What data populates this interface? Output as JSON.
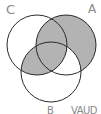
{
  "diagram": {
    "type": "venn-3",
    "labels": {
      "C": "C",
      "A": "A",
      "B": "B",
      "set_expression": "VAUD"
    },
    "circles": [
      {
        "name": "C",
        "cx": 37,
        "cy": 45,
        "r": 30
      },
      {
        "name": "A",
        "cx": 66,
        "cy": 45,
        "r": 30
      },
      {
        "name": "B",
        "cx": 51,
        "cy": 72,
        "r": 30
      }
    ],
    "shaded_regions": [
      "A only",
      "A∩C only",
      "A∩B∩C",
      "B∩C only"
    ],
    "unshaded_regions": [
      "C only",
      "B only",
      "A∩B only"
    ],
    "colors": {
      "shade": "#b3b3b3",
      "stroke": "#2a2a2a",
      "label": "#8a8a8a",
      "background": "#ffffff"
    }
  }
}
